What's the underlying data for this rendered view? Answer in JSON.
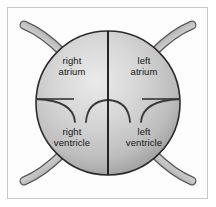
{
  "figure": {
    "frame_color": "#c9c9c9",
    "background_color": "#ffffff"
  },
  "heart": {
    "shape": "circle",
    "center_x": 108,
    "center_y": 103,
    "radius": 72,
    "fill_light": "#e8e8e8",
    "fill_mid": "#c5c5c5",
    "fill_dark": "#8f8f8f",
    "outline_color": "#2b2b2b"
  },
  "septum": {
    "name": "interventricular septum",
    "color": "#1c1c1c",
    "orientation": "vertical"
  },
  "valve_plane": {
    "name": "atrioventricular valve plane",
    "color": "#2b2b2b",
    "orientation": "horizontal"
  },
  "chambers": [
    {
      "id": "right-atrium",
      "label": "right\natrium",
      "side": "right",
      "position": "upper-left"
    },
    {
      "id": "left-atrium",
      "label": "left\natrium",
      "side": "left",
      "position": "upper-right"
    },
    {
      "id": "right-ventricle",
      "label": "right\nventricle",
      "side": "right",
      "position": "lower-left"
    },
    {
      "id": "left-ventricle",
      "label": "left\nventricle",
      "side": "left",
      "position": "lower-right"
    }
  ],
  "valves": [
    {
      "id": "tricuspid-outer-leaflet",
      "chamber": "right",
      "type": "outer"
    },
    {
      "id": "tricuspid-inner-leaflet",
      "chamber": "right",
      "type": "inner"
    },
    {
      "id": "mitral-inner-leaflet",
      "chamber": "left",
      "type": "inner"
    },
    {
      "id": "mitral-outer-leaflet",
      "chamber": "left",
      "type": "outer"
    }
  ],
  "vessels": [
    {
      "id": "vessel-top-left",
      "corner": "top-left",
      "tube_light": "#dcdcdc",
      "tube_dark": "#6e6e6e"
    },
    {
      "id": "vessel-top-right",
      "corner": "top-right",
      "tube_light": "#dcdcdc",
      "tube_dark": "#6e6e6e"
    },
    {
      "id": "vessel-bottom-left",
      "corner": "bottom-left",
      "tube_light": "#dcdcdc",
      "tube_dark": "#6e6e6e"
    },
    {
      "id": "vessel-bottom-right",
      "corner": "bottom-right",
      "tube_light": "#dcdcdc",
      "tube_dark": "#6e6e6e"
    }
  ]
}
